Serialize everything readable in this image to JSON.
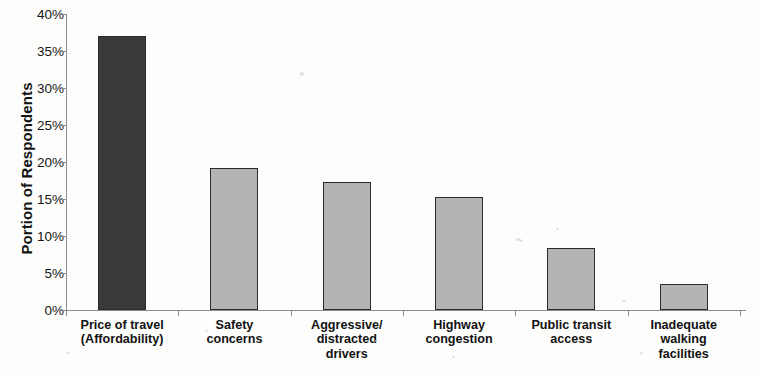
{
  "chart_data": {
    "type": "bar",
    "title": "",
    "xlabel": "",
    "ylabel": "Portion of Respondents",
    "ylim": [
      0,
      40
    ],
    "ytick_step": 5,
    "ytick_labels": [
      "40%",
      "35%",
      "30%",
      "25%",
      "20%",
      "15%",
      "10%",
      "5%",
      "0%"
    ],
    "ytick_values": [
      40,
      35,
      30,
      25,
      20,
      15,
      10,
      5,
      0
    ],
    "grid": false,
    "legend": false,
    "value_suffix": "%",
    "categories": [
      "Price of travel (Affordability)",
      "Safety concerns",
      "Aggressive/ distracted drivers",
      "Highway congestion",
      "Public transit access",
      "Inadequate walking facilities"
    ],
    "category_lines": [
      [
        "Price of travel",
        "(Affordability)"
      ],
      [
        "Safety",
        "concerns"
      ],
      [
        "Aggressive/",
        "distracted",
        "drivers"
      ],
      [
        "Highway",
        "congestion"
      ],
      [
        "Public transit",
        "access"
      ],
      [
        "Inadequate",
        "walking",
        "facilities"
      ]
    ],
    "values": [
      37.0,
      19.2,
      17.3,
      15.3,
      8.4,
      3.5
    ],
    "bar_colors": [
      "#3a3a3a",
      "#b4b4b4",
      "#b4b4b4",
      "#b4b4b4",
      "#b4b4b4",
      "#b4b4b4"
    ],
    "bar_border_color": "#2b2b2b",
    "axis_color": "#8c8c8c",
    "highlight_color": "#3a3a3a",
    "series_color": "#b4b4b4"
  }
}
